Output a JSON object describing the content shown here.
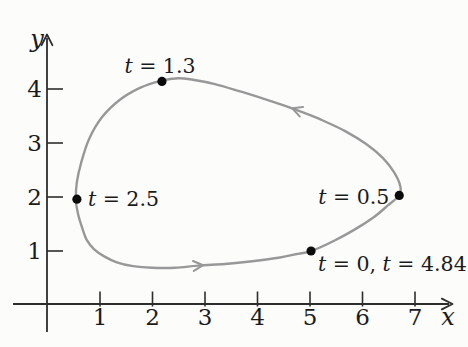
{
  "figure": {
    "background": "#fcfcfb",
    "curve_color": "#989898",
    "axis_color": "#2d2d2d",
    "text_color": "#1b1b1b",
    "point_color": "#0b0b0b"
  },
  "chart_data": {
    "type": "line",
    "subtype": "parametric-closed-curve",
    "title": "",
    "xlabel": "x",
    "ylabel": "y",
    "xlim": [
      0,
      7.75
    ],
    "ylim": [
      0,
      5.05
    ],
    "x_ticks": [
      1,
      2,
      3,
      4,
      5,
      6,
      7
    ],
    "y_ticks": [
      1,
      2,
      3,
      4
    ],
    "grid": false,
    "direction": "counterclockwise",
    "curve_points": [
      [
        5.02,
        1.0
      ],
      [
        5.46,
        1.19
      ],
      [
        5.84,
        1.39
      ],
      [
        6.22,
        1.63
      ],
      [
        6.49,
        1.85
      ],
      [
        6.7,
        2.03
      ],
      [
        6.72,
        2.2
      ],
      [
        6.6,
        2.46
      ],
      [
        6.39,
        2.72
      ],
      [
        6.07,
        2.98
      ],
      [
        5.67,
        3.22
      ],
      [
        5.19,
        3.44
      ],
      [
        4.75,
        3.61
      ],
      [
        4.24,
        3.78
      ],
      [
        3.72,
        3.94
      ],
      [
        3.19,
        4.09
      ],
      [
        2.77,
        4.17
      ],
      [
        2.49,
        4.2
      ],
      [
        2.16,
        4.15
      ],
      [
        1.76,
        4.02
      ],
      [
        1.38,
        3.8
      ],
      [
        1.04,
        3.48
      ],
      [
        0.79,
        3.07
      ],
      [
        0.64,
        2.63
      ],
      [
        0.56,
        2.28
      ],
      [
        0.54,
        1.96
      ],
      [
        0.58,
        1.69
      ],
      [
        0.66,
        1.43
      ],
      [
        0.75,
        1.2
      ],
      [
        0.89,
        1.03
      ],
      [
        1.08,
        0.9
      ],
      [
        1.32,
        0.79
      ],
      [
        1.63,
        0.72
      ],
      [
        1.99,
        0.69
      ],
      [
        2.43,
        0.69
      ],
      [
        2.87,
        0.73
      ],
      [
        3.38,
        0.76
      ],
      [
        3.9,
        0.81
      ],
      [
        4.43,
        0.88
      ],
      [
        4.73,
        0.94
      ]
    ],
    "closed": true,
    "direction_arrows": [
      {
        "index": 35,
        "comment": "bottom of loop, points right"
      },
      {
        "index": 12,
        "comment": "upper right of loop, points up-left"
      }
    ],
    "labeled_points": [
      {
        "t_values": [
          1.3
        ],
        "x": 2.18,
        "y": 4.14,
        "label": [
          {
            "it": true,
            "s": "t"
          },
          {
            "it": false,
            "s": " = 1.3"
          }
        ],
        "anchor": "middle",
        "dx": -2,
        "dy": -8
      },
      {
        "t_values": [
          2.5
        ],
        "x": 0.56,
        "y": 1.96,
        "label": [
          {
            "it": true,
            "s": "t"
          },
          {
            "it": false,
            "s": " = 2.5"
          }
        ],
        "anchor": "start",
        "dx": 11,
        "dy": 7
      },
      {
        "t_values": [
          0.5
        ],
        "x": 6.7,
        "y": 2.03,
        "label": [
          {
            "it": true,
            "s": "t"
          },
          {
            "it": false,
            "s": " = 0.5"
          }
        ],
        "anchor": "end",
        "dx": -10,
        "dy": 9
      },
      {
        "t_values": [
          0,
          4.84
        ],
        "x": 5.02,
        "y": 1.0,
        "label": [
          {
            "it": true,
            "s": "t"
          },
          {
            "it": false,
            "s": " = 0, "
          },
          {
            "it": true,
            "s": "t"
          },
          {
            "it": false,
            "s": " = 4.84"
          }
        ],
        "anchor": "start",
        "dx": 7,
        "dy": 20
      }
    ]
  }
}
